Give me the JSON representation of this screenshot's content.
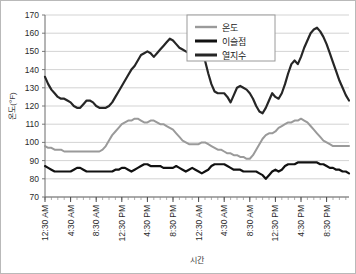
{
  "chart_data": {
    "type": "line",
    "title": "",
    "xlabel": "시간",
    "ylabel": "온도(°F)",
    "ylim": [
      70,
      170
    ],
    "ytick_step": 10,
    "yticks": [
      70,
      80,
      90,
      100,
      110,
      120,
      130,
      140,
      150,
      160,
      170
    ],
    "grid": true,
    "legend_position": "top-center",
    "xlabel_rotation": -90,
    "xticks": [
      "12:30 AM",
      "4:30 AM",
      "8:30 AM",
      "12:30 PM",
      "4:30 PM",
      "8:30 PM",
      "12:30 AM",
      "4:30 AM",
      "8:30 AM",
      "12:30 PM",
      "4:30 PM",
      "8:30 PM"
    ],
    "xtick_indices": [
      0,
      8,
      16,
      24,
      32,
      40,
      48,
      56,
      64,
      72,
      80,
      88
    ],
    "n_points": 96,
    "series": [
      {
        "name": "온도",
        "color": "#9a9a9a",
        "width": 2.0,
        "values": [
          98,
          97,
          97,
          96,
          96,
          96,
          95,
          95,
          95,
          95,
          95,
          95,
          95,
          95,
          95,
          95,
          95,
          95,
          96,
          98,
          101,
          104,
          106,
          108,
          110,
          111,
          112,
          112,
          113,
          113,
          112,
          111,
          111,
          112,
          112,
          111,
          110,
          110,
          109,
          108,
          107,
          105,
          103,
          101,
          100,
          99,
          99,
          99,
          99,
          100,
          100,
          99,
          98,
          97,
          96,
          96,
          95,
          94,
          94,
          93,
          93,
          92,
          92,
          91,
          91,
          93,
          96,
          99,
          102,
          104,
          105,
          105,
          106,
          108,
          109,
          110,
          111,
          111,
          112,
          112,
          113,
          112,
          111,
          109,
          107,
          105,
          103,
          101,
          100,
          99,
          98,
          98,
          98,
          98,
          98,
          98
        ]
      },
      {
        "name": "이슬점",
        "color": "#111111",
        "width": 2.2,
        "values": [
          87,
          86,
          85,
          84,
          84,
          84,
          84,
          84,
          84,
          85,
          86,
          86,
          85,
          84,
          84,
          84,
          84,
          84,
          84,
          84,
          84,
          84,
          85,
          85,
          86,
          86,
          85,
          84,
          85,
          86,
          87,
          88,
          88,
          87,
          87,
          87,
          87,
          86,
          86,
          86,
          86,
          87,
          86,
          85,
          84,
          85,
          86,
          85,
          84,
          83,
          84,
          85,
          87,
          88,
          88,
          88,
          88,
          87,
          86,
          85,
          85,
          85,
          84,
          84,
          84,
          84,
          84,
          83,
          82,
          80,
          82,
          84,
          85,
          84,
          85,
          87,
          88,
          88,
          88,
          89,
          89,
          89,
          89,
          89,
          89,
          89,
          88,
          88,
          87,
          86,
          86,
          85,
          85,
          84,
          84,
          83
        ]
      },
      {
        "name": "열지수",
        "color": "#262626",
        "width": 2.2,
        "values": [
          136,
          132,
          129,
          127,
          125,
          124,
          124,
          123,
          122,
          120,
          119,
          119,
          121,
          123,
          123,
          122,
          120,
          119,
          119,
          119,
          120,
          122,
          125,
          128,
          131,
          134,
          137,
          140,
          142,
          145,
          148,
          149,
          150,
          149,
          147,
          149,
          151,
          153,
          155,
          157,
          156,
          154,
          152,
          151,
          150,
          149,
          148,
          147,
          147,
          146,
          145,
          138,
          132,
          128,
          127,
          127,
          127,
          125,
          122,
          126,
          130,
          131,
          130,
          129,
          127,
          124,
          120,
          117,
          116,
          119,
          123,
          127,
          125,
          124,
          127,
          132,
          138,
          143,
          145,
          143,
          147,
          152,
          156,
          160,
          162,
          163,
          161,
          158,
          154,
          149,
          144,
          139,
          134,
          130,
          126,
          123
        ]
      }
    ]
  },
  "legend": {
    "items": [
      {
        "label": "온도"
      },
      {
        "label": "이슬점"
      },
      {
        "label": "열지수"
      }
    ]
  }
}
